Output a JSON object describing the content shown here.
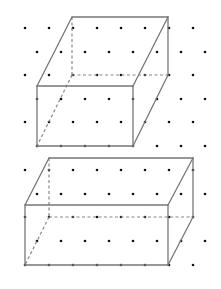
{
  "figure": {
    "width": 221,
    "height": 289,
    "colors": {
      "background": "#ffffff",
      "dot": "#111111",
      "edge": "#777777",
      "hidden_edge": "#888888"
    },
    "dot_grid": {
      "spacing_x": 24,
      "spacing_y": 23.5,
      "row_offset": 12,
      "rows": [
        {
          "y": 28,
          "xs": [
            25,
            49,
            73,
            97,
            121,
            145,
            169,
            193
          ]
        },
        {
          "y": 52,
          "xs": [
            37,
            61,
            85,
            109,
            133,
            157,
            181,
            205
          ]
        },
        {
          "y": 75,
          "xs": [
            25,
            49,
            73,
            97,
            121,
            145,
            169,
            193
          ]
        },
        {
          "y": 99,
          "xs": [
            37,
            61,
            85,
            109,
            133,
            157,
            181,
            205
          ]
        },
        {
          "y": 122,
          "xs": [
            25,
            49,
            73,
            97,
            121,
            145,
            169,
            193
          ]
        },
        {
          "y": 146,
          "xs": [
            37,
            61,
            85,
            109,
            133,
            157,
            181,
            205
          ]
        },
        {
          "y": 170,
          "xs": [
            25,
            49,
            73,
            97,
            121,
            145,
            169,
            193
          ]
        },
        {
          "y": 194,
          "xs": [
            37,
            61,
            85,
            109,
            133,
            157,
            181,
            205
          ]
        },
        {
          "y": 217,
          "xs": [
            25,
            49,
            73,
            97,
            121,
            145,
            169,
            193
          ]
        },
        {
          "y": 241,
          "xs": [
            37,
            61,
            85,
            109,
            133,
            157,
            181,
            205
          ]
        },
        {
          "y": 265,
          "xs": [
            25,
            49,
            73,
            97,
            121,
            145,
            169,
            193
          ]
        }
      ]
    },
    "shapes": [
      {
        "name": "cuboid-top",
        "visible_edges": [
          [
            72,
            17,
            168,
            17
          ],
          [
            72,
            17,
            37,
            86
          ],
          [
            168,
            17,
            133,
            86
          ],
          [
            37,
            86,
            133,
            86
          ],
          [
            37,
            86,
            37,
            146
          ],
          [
            133,
            86,
            133,
            146
          ],
          [
            37,
            146,
            133,
            146
          ],
          [
            168,
            17,
            168,
            75
          ],
          [
            168,
            75,
            133,
            146
          ]
        ],
        "hidden_edges": [
          [
            72,
            17,
            72,
            75
          ],
          [
            72,
            75,
            168,
            75
          ],
          [
            72,
            75,
            37,
            146
          ]
        ]
      },
      {
        "name": "cuboid-bottom",
        "visible_edges": [
          [
            49,
            158,
            193,
            158
          ],
          [
            49,
            158,
            25,
            205
          ],
          [
            193,
            158,
            168,
            205
          ],
          [
            25,
            205,
            168,
            205
          ],
          [
            25,
            205,
            25,
            265
          ],
          [
            168,
            205,
            168,
            265
          ],
          [
            25,
            265,
            168,
            265
          ],
          [
            193,
            158,
            193,
            217
          ],
          [
            193,
            217,
            168,
            265
          ]
        ],
        "hidden_edges": [
          [
            49,
            158,
            49,
            217
          ],
          [
            49,
            217,
            193,
            217
          ],
          [
            49,
            217,
            25,
            265
          ]
        ]
      }
    ]
  }
}
